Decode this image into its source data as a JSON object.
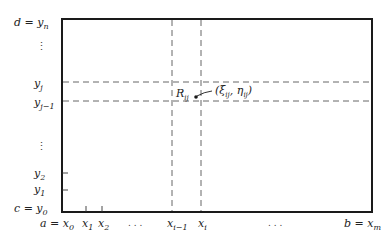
{
  "diagram": {
    "type": "partition-of-rectangle",
    "colors": {
      "ink": "#1a1a1a",
      "dash": "#555555",
      "text": "#222222"
    },
    "box": {
      "left": 62,
      "top": 19,
      "right": 372,
      "bottom": 212
    },
    "y_labels": [
      {
        "text": "d = y",
        "sub": "n",
        "y": 22
      },
      {
        "text": "y",
        "sub": "j",
        "y": 85
      },
      {
        "text": "y",
        "sub": "j−1",
        "y": 104
      },
      {
        "text": "y",
        "sub": "2",
        "y": 175
      },
      {
        "text": "y",
        "sub": "1",
        "y": 192
      },
      {
        "text": "c = y",
        "sub": "0",
        "y": 211
      }
    ],
    "x_labels": [
      {
        "text": "a = x",
        "sub": "0",
        "x": 47
      },
      {
        "text": "x",
        "sub": "1",
        "x": 83
      },
      {
        "text": "x",
        "sub": "2",
        "x": 99
      },
      {
        "text": "x",
        "sub": "i−1",
        "x": 168
      },
      {
        "text": "x",
        "sub": "i",
        "x": 199
      },
      {
        "text": "b = x",
        "sub": "m",
        "x": 343
      }
    ],
    "dots": {
      "vertical_top": "⋮",
      "vertical_bottom": "⋮",
      "horizontal_left": ". . .",
      "horizontal_right": ". . ."
    },
    "dashed_vertical_x": [
      172,
      201
    ],
    "dashed_horizontal_y": [
      82,
      101
    ],
    "ticks_left_y": [
      173,
      190
    ],
    "ticks_bottom_x": [
      86,
      102
    ],
    "region_label": {
      "text": "R",
      "sub": "ij"
    },
    "point_label": {
      "text": "(ξ",
      "sub1": "ij",
      "mid": ", η",
      "sub2": "ij",
      "end": ")"
    }
  }
}
